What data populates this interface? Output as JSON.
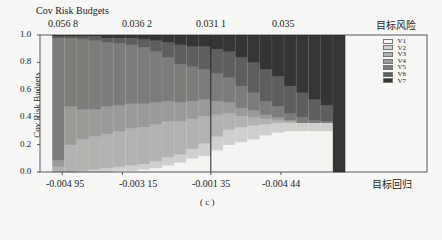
{
  "chart_data": {
    "type": "bar",
    "stacked": true,
    "title": "Cov Risk Budgets",
    "ylabel": "Cov Risk Budgets",
    "xlabel": "目标回归",
    "top_axis_label": "目标风险",
    "right_label": "Rmetrice",
    "caption": "( c )",
    "ylim": [
      0,
      1.0
    ],
    "yticks": [
      "0.0",
      "0.2",
      "0.4",
      "0.6",
      "0.8",
      "1.0"
    ],
    "top_ticks": [
      "0.056 8",
      "0.036 2",
      "0.031 1",
      "0.035"
    ],
    "bottom_ticks": [
      "-0.004 95",
      "-0.003 15",
      "-0.001 35",
      "-0.004 44"
    ],
    "legend": [
      "V1",
      "V2",
      "V3",
      "V4",
      "V5",
      "V6",
      "V7"
    ],
    "colors": [
      "#f4f4f2",
      "#cfcfcd",
      "#b2b2b0",
      "#9a9a98",
      "#7c7c7a",
      "#5e5e5c",
      "#353533"
    ],
    "series": [
      {
        "name": "V1",
        "values": [
          1.0,
          0.0,
          0.0,
          0.0,
          0.0,
          0.0,
          0.01,
          0.01,
          0.02,
          0.03,
          0.05,
          0.07,
          0.1,
          0.12,
          0.16,
          0.2,
          0.22,
          0.24,
          0.27,
          0.29,
          0.3,
          0.3,
          0.3,
          0.3,
          0.0
        ]
      },
      {
        "name": "V2",
        "values": [
          0.0,
          0.0,
          0.0,
          0.01,
          0.02,
          0.03,
          0.03,
          0.04,
          0.04,
          0.05,
          0.06,
          0.06,
          0.07,
          0.09,
          0.1,
          0.11,
          0.11,
          0.1,
          0.08,
          0.07,
          0.06,
          0.06,
          0.06,
          0.06,
          0.0
        ]
      },
      {
        "name": "V3",
        "values": [
          0.0,
          0.04,
          0.2,
          0.23,
          0.24,
          0.25,
          0.26,
          0.27,
          0.27,
          0.27,
          0.26,
          0.24,
          0.22,
          0.2,
          0.16,
          0.12,
          0.08,
          0.06,
          0.04,
          0.02,
          0.01,
          0.0,
          0.0,
          0.0,
          0.0
        ]
      },
      {
        "name": "V4",
        "values": [
          0.0,
          0.05,
          0.28,
          0.22,
          0.2,
          0.2,
          0.19,
          0.18,
          0.17,
          0.16,
          0.15,
          0.14,
          0.13,
          0.12,
          0.1,
          0.08,
          0.06,
          0.05,
          0.03,
          0.02,
          0.01,
          0.0,
          0.0,
          0.0,
          0.0
        ]
      },
      {
        "name": "V5",
        "values": [
          0.0,
          0.89,
          0.5,
          0.51,
          0.5,
          0.47,
          0.45,
          0.43,
          0.41,
          0.37,
          0.32,
          0.28,
          0.25,
          0.22,
          0.2,
          0.18,
          0.16,
          0.13,
          0.1,
          0.08,
          0.05,
          0.04,
          0.02,
          0.01,
          0.0
        ]
      },
      {
        "name": "V6",
        "values": [
          0.0,
          0.01,
          0.01,
          0.02,
          0.03,
          0.03,
          0.04,
          0.05,
          0.06,
          0.08,
          0.11,
          0.14,
          0.15,
          0.17,
          0.18,
          0.19,
          0.21,
          0.22,
          0.23,
          0.22,
          0.2,
          0.18,
          0.15,
          0.12,
          0.0
        ]
      },
      {
        "name": "V7",
        "values": [
          0.0,
          0.01,
          0.01,
          0.01,
          0.01,
          0.02,
          0.02,
          0.02,
          0.03,
          0.04,
          0.05,
          0.07,
          0.08,
          0.08,
          0.1,
          0.12,
          0.16,
          0.2,
          0.25,
          0.3,
          0.37,
          0.42,
          0.47,
          0.51,
          1.0
        ]
      }
    ],
    "vertical_line_at_bar": 14
  }
}
